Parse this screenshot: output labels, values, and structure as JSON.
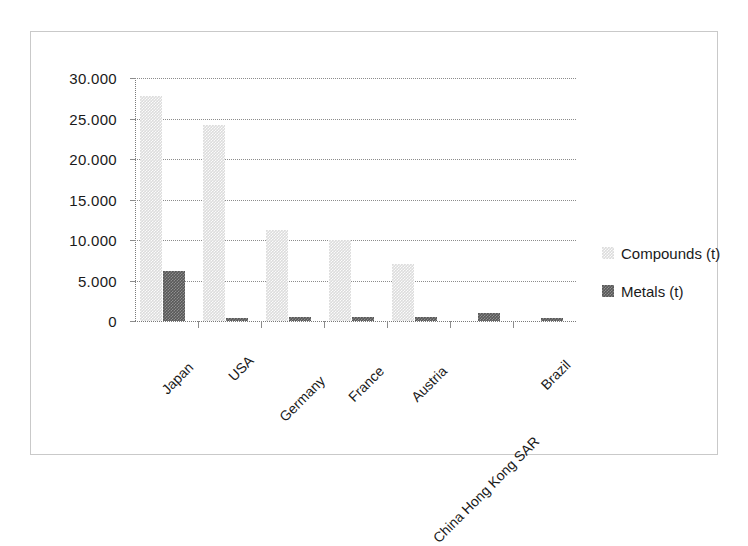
{
  "chart_data": {
    "type": "bar",
    "title": "",
    "subtitle": "",
    "xlabel": "",
    "ylabel": "",
    "categories": [
      "Japan",
      "USA",
      "Germany",
      "France",
      "Austria",
      "China Hong Kong SAR",
      "Brazil"
    ],
    "series": [
      {
        "name": "Compounds (t)",
        "color": "#DCDCDC",
        "values": [
          27800,
          24200,
          11200,
          10000,
          7000,
          0,
          0
        ]
      },
      {
        "name": "Metals (t)",
        "color": "#585858",
        "values": [
          6200,
          400,
          500,
          450,
          550,
          1000,
          400
        ]
      }
    ],
    "ylim": [
      0,
      30000
    ],
    "ytick_values": [
      0,
      5000,
      10000,
      15000,
      20000,
      25000,
      30000
    ],
    "ytick_labels": [
      "0",
      "5.000",
      "10.000",
      "15.000",
      "20.000",
      "25.000",
      "30.000"
    ],
    "grid": true,
    "grid_style": "dotted-horizontal",
    "legend_position": "right",
    "xtick_label_rotation": -45
  },
  "legend": {
    "entries": [
      {
        "label": "Compounds (t)",
        "swatch": "compounds"
      },
      {
        "label": "Metals (t)",
        "swatch": "metals"
      }
    ]
  }
}
